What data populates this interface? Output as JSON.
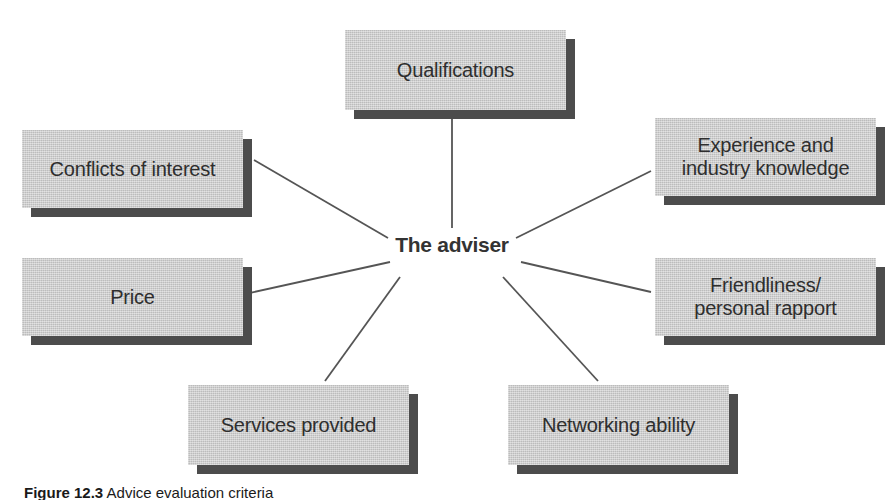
{
  "figure": {
    "hub": {
      "label": "The adviser"
    },
    "caption": {
      "label": "Figure 12.3",
      "text": "Advice evaluation criteria"
    },
    "colors": {
      "box_fill": "#c9c9c9",
      "box_shadow": "#4c4c4c",
      "text": "#2e2e2e",
      "hub_text": "#333333",
      "connector": "#555555",
      "background": "#ffffff"
    },
    "nodes": [
      {
        "id": "qualifications",
        "label": "Qualifications",
        "x": 345,
        "y": 30,
        "w": 221,
        "h": 80
      },
      {
        "id": "experience",
        "label": "Experience and\nindustry knowledge",
        "x": 655,
        "y": 118,
        "w": 221,
        "h": 78
      },
      {
        "id": "friendliness",
        "label": "Friendliness/\npersonal rapport",
        "x": 655,
        "y": 258,
        "w": 221,
        "h": 78
      },
      {
        "id": "networking",
        "label": "Networking ability",
        "x": 508,
        "y": 385,
        "w": 221,
        "h": 80
      },
      {
        "id": "services",
        "label": "Services provided",
        "x": 188,
        "y": 385,
        "w": 221,
        "h": 80
      },
      {
        "id": "price",
        "label": "Price",
        "x": 22,
        "y": 258,
        "w": 221,
        "h": 78
      },
      {
        "id": "conflicts",
        "label": "Conflicts of interest",
        "x": 22,
        "y": 130,
        "w": 221,
        "h": 78
      }
    ],
    "connectors": [
      {
        "id": "hub-to-qualifications",
        "x1": 452,
        "y1": 228,
        "x2": 452,
        "y2": 118
      },
      {
        "id": "hub-to-experience",
        "x1": 516,
        "y1": 238,
        "x2": 651,
        "y2": 171
      },
      {
        "id": "hub-to-friendliness",
        "x1": 521,
        "y1": 262,
        "x2": 651,
        "y2": 292
      },
      {
        "id": "hub-to-networking",
        "x1": 503,
        "y1": 277,
        "x2": 598,
        "y2": 381
      },
      {
        "id": "hub-to-services",
        "x1": 400,
        "y1": 277,
        "x2": 325,
        "y2": 381
      },
      {
        "id": "hub-to-price",
        "x1": 390,
        "y1": 262,
        "x2": 245,
        "y2": 294
      },
      {
        "id": "hub-to-conflicts",
        "x1": 388,
        "y1": 238,
        "x2": 254,
        "y2": 160
      }
    ]
  }
}
